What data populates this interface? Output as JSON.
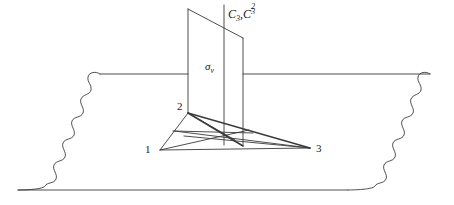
{
  "figure": {
    "background_color": "#ffffff",
    "stroke_color": "#3a3a3a",
    "text_color": "#1a1a1a",
    "width": 454,
    "height": 205
  },
  "labels": {
    "vertex_1": "1",
    "vertex_2": "2",
    "vertex_3": "3",
    "rotation_axis_base": "C",
    "rotation_axis_sub": "3",
    "rotation_axis_comma": ",",
    "rotation_axis_second_base": "C",
    "rotation_axis_second_sub": "3",
    "rotation_axis_second_sup": "2",
    "mirror_plane_base": "σ",
    "mirror_plane_sub": "v"
  },
  "geometry": {
    "ground_plane": {
      "top_left_x": 100,
      "top_right_x": 430,
      "top_y": 74,
      "bottom_left_x": 18,
      "bottom_right_x": 348,
      "bottom_y": 190,
      "edge_style": "wavy"
    },
    "triangle": {
      "vertex_1": [
        160,
        150
      ],
      "vertex_2": [
        188,
        113
      ],
      "vertex_3": [
        310,
        148
      ],
      "centroid": [
        224,
        143
      ]
    },
    "mirror_plane": {
      "top_left": [
        188,
        9
      ],
      "top_right": [
        243,
        38
      ],
      "bottom_right": [
        243,
        146
      ],
      "bottom_left": [
        188,
        113
      ]
    },
    "rotation_axis": {
      "x": 224,
      "top_y": 5,
      "bottom_y": 145
    }
  }
}
